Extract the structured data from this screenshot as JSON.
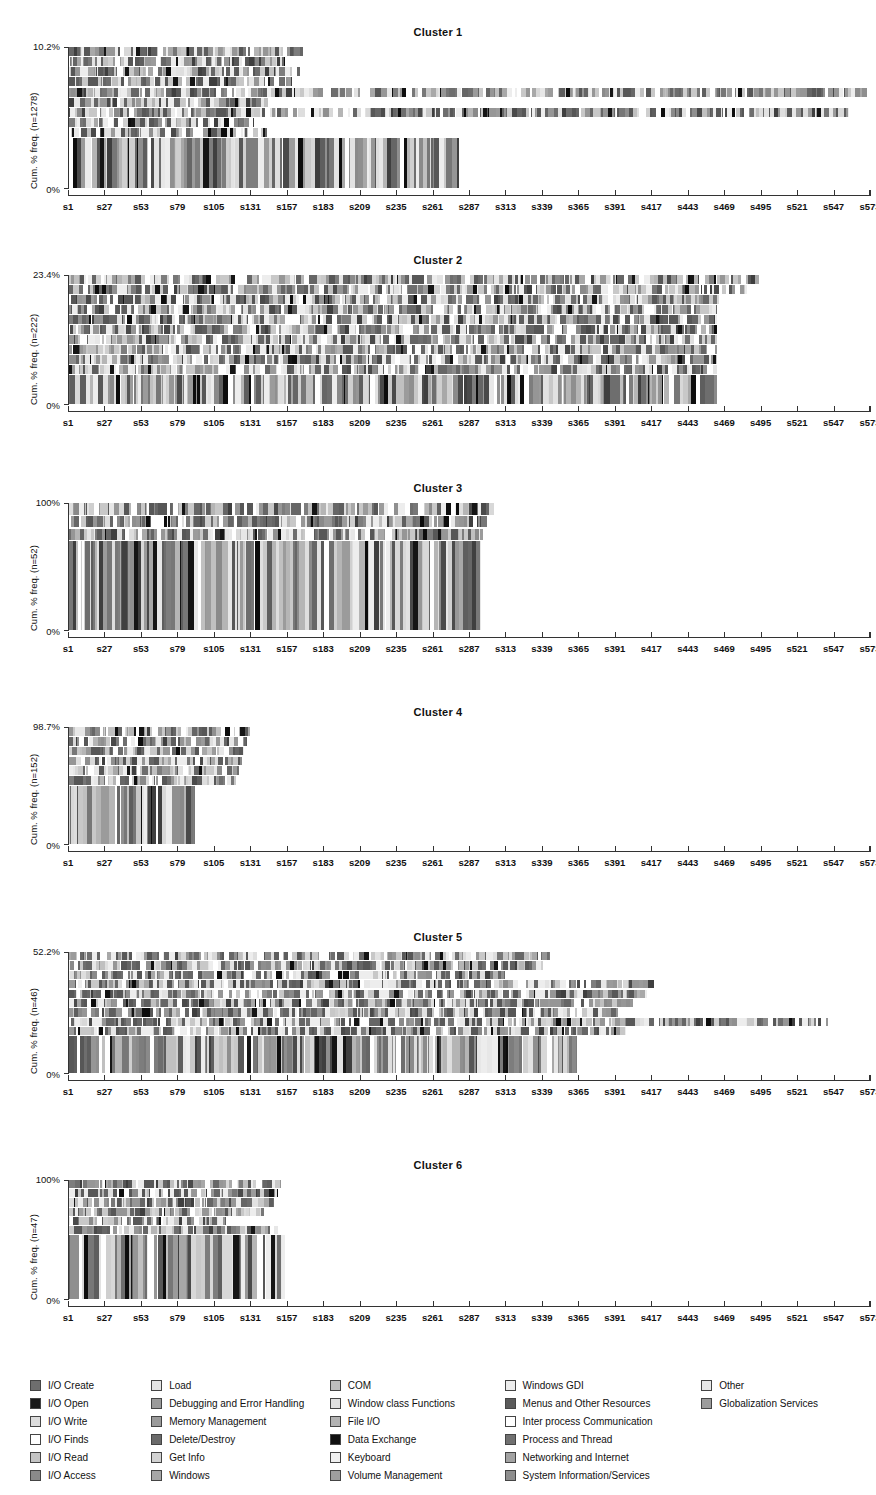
{
  "chart_data": {
    "type": "bar",
    "chart_kind": "state-sequence-index-plot",
    "title": "",
    "xlabel": "",
    "ylabel": "Cum. % freq.",
    "grid": false,
    "legend_position": "bottom",
    "x_tick_labels": [
      "s1",
      "s27",
      "s53",
      "s79",
      "s105",
      "s131",
      "s157",
      "s183",
      "s209",
      "s235",
      "s261",
      "s287",
      "s313",
      "s339",
      "s365",
      "s391",
      "s417",
      "s443",
      "s469",
      "s495",
      "s521",
      "s547",
      "s573"
    ],
    "x_tick_values": [
      1,
      27,
      53,
      79,
      105,
      131,
      157,
      183,
      209,
      235,
      261,
      287,
      313,
      339,
      365,
      391,
      417,
      443,
      469,
      495,
      521,
      547,
      573
    ],
    "xlim": [
      1,
      573
    ],
    "palette": [
      "#4a4a4a",
      "#151515",
      "#d8d8d8",
      "#ffffff",
      "#c0c0c0",
      "#6e6e6e",
      "#e2e2e2",
      "#8f8f8f",
      "#9b9b9b",
      "#3f3f3f",
      "#cfcfcf",
      "#7d7d7d",
      "#a8a8a8",
      "#dedede",
      "#b5b5b5",
      "#0d0d0d",
      "#ededed",
      "#969696",
      "#c8c8c8",
      "#575757",
      "#ffffff",
      "#666666",
      "#8a8a8a",
      "#777777",
      "#e7e7e7",
      "#5e5e5e"
    ],
    "panels": [
      {
        "title": "Cluster 1",
        "n": 1278,
        "y_top_label": "10.2%",
        "y_bottom_label": "0%",
        "ylabel_full": "Cum. % freq. (n=1278)",
        "ylim": [
          0,
          10.2
        ],
        "band_lengths": [
          168,
          155,
          167,
          160,
          573,
          143,
          560,
          133,
          142,
          280
        ],
        "band_weights": [
          1,
          1,
          1,
          1,
          1,
          1,
          1,
          1,
          1,
          5
        ]
      },
      {
        "title": "Cluster 2",
        "n": 222,
        "y_top_label": "23.4%",
        "y_bottom_label": "0%",
        "ylabel_full": "Cum. % freq. (n=222)",
        "ylim": [
          0,
          23.4
        ],
        "band_lengths": [
          495,
          487,
          467,
          465,
          465,
          465,
          465,
          465,
          465,
          465,
          465
        ],
        "band_weights": [
          1,
          1,
          1,
          1,
          1,
          1,
          1,
          1,
          1,
          1,
          3
        ]
      },
      {
        "title": "Cluster 3",
        "n": 52,
        "y_top_label": "100%",
        "y_bottom_label": "0%",
        "ylabel_full": "Cum. % freq. (n=52)",
        "ylim": [
          0,
          100
        ],
        "band_lengths": [
          305,
          300,
          297,
          297
        ],
        "band_weights": [
          1,
          1,
          1,
          7
        ]
      },
      {
        "title": "Cluster 4",
        "n": 152,
        "y_top_label": "98.7%",
        "y_bottom_label": "0%",
        "ylabel_full": "Cum. % freq. (n=152)",
        "ylim": [
          0,
          98.7
        ],
        "band_lengths": [
          130,
          128,
          126,
          124,
          122,
          120,
          90
        ],
        "band_weights": [
          1,
          1,
          1,
          1,
          1,
          1,
          6
        ]
      },
      {
        "title": "Cluster 5",
        "n": 46,
        "y_top_label": "52.2%",
        "y_bottom_label": "0%",
        "ylabel_full": "Cum. % freq. (n=46)",
        "ylim": [
          0,
          52.2
        ],
        "band_lengths": [
          345,
          340,
          313,
          420,
          415,
          405,
          398,
          545,
          400,
          365
        ],
        "band_weights": [
          1,
          1,
          1,
          1,
          1,
          1,
          1,
          1,
          1,
          4
        ]
      },
      {
        "title": "Cluster 6",
        "n": 47,
        "y_top_label": "100%",
        "y_bottom_label": "0%",
        "ylabel_full": "Cum. % freq. (n=47)",
        "ylim": [
          0,
          100
        ],
        "band_lengths": [
          152,
          150,
          147,
          140,
          113,
          150,
          155
        ],
        "band_weights": [
          1,
          1,
          1,
          1,
          1,
          1,
          7
        ]
      }
    ],
    "legend_columns": [
      {
        "items": [
          {
            "label": "I/O Create",
            "color": "#6e6e6e"
          },
          {
            "label": "I/O Open",
            "color": "#1a1a1a"
          },
          {
            "label": "I/O Write",
            "color": "#dcdcdc"
          },
          {
            "label": "I/O Finds",
            "color": "#ffffff"
          },
          {
            "label": "I/O Read",
            "color": "#c4c4c4"
          },
          {
            "label": "I/O Access",
            "color": "#8a8a8a"
          }
        ]
      },
      {
        "items": [
          {
            "label": "Load",
            "color": "#e4e4e4"
          },
          {
            "label": "Debugging and Error Handling",
            "color": "#9a9a9a"
          },
          {
            "label": "Memory Management",
            "color": "#9a9a9a"
          },
          {
            "label": "Delete/Destroy",
            "color": "#6a6a6a"
          },
          {
            "label": "Get Info",
            "color": "#d2d2d2"
          },
          {
            "label": "Windows",
            "color": "#a6a6a6"
          }
        ]
      },
      {
        "items": [
          {
            "label": "COM",
            "color": "#bdbdbd"
          },
          {
            "label": "Window class Functions",
            "color": "#e0e0e0"
          },
          {
            "label": "File I/O",
            "color": "#b2b2b2"
          },
          {
            "label": "Data Exchange",
            "color": "#101010"
          },
          {
            "label": "Keyboard",
            "color": "#f0f0f0"
          },
          {
            "label": "Volume Management",
            "color": "#9e9e9e"
          }
        ]
      },
      {
        "items": [
          {
            "label": "Windows GDI",
            "color": "#ececec"
          },
          {
            "label": "Menus and Other Resources",
            "color": "#5a5a5a"
          },
          {
            "label": "Inter process Communication",
            "color": "#ffffff"
          },
          {
            "label": "Process and Thread",
            "color": "#707070"
          },
          {
            "label": "Networking and Internet",
            "color": "#a2a2a2"
          },
          {
            "label": "System Information/Services",
            "color": "#8e8e8e"
          }
        ]
      },
      {
        "items": [
          {
            "label": "Other",
            "color": "#e8e8e8"
          },
          {
            "label": "Globalization Services",
            "color": "#9c9c9c"
          }
        ]
      }
    ]
  }
}
